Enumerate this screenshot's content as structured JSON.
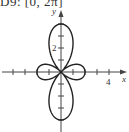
{
  "title": "D9: [0, 2π]",
  "chart_data": {
    "type": "line",
    "title": "D9: [0, 2π]",
    "xlabel": "x",
    "ylabel": "y",
    "x_tick_labels": [
      "4"
    ],
    "y_tick_labels": [
      "2"
    ],
    "xlim": [
      -5,
      5.5
    ],
    "ylim": [
      -4.2,
      5.5
    ],
    "grid": false,
    "curve": "polar rose with two long lobes on the y-axis reaching ±4 and two short lobes on the x-axis reaching ±2, drawn over θ in [0, 2π]",
    "series": [
      {
        "name": "polar curve",
        "points": [
          [
            0,
            4
          ],
          [
            0,
            -4
          ],
          [
            2,
            0
          ],
          [
            -2,
            0
          ],
          [
            0,
            0
          ]
        ]
      }
    ]
  },
  "labels": {
    "x_axis": "x",
    "y_axis": "y",
    "x_tick": "4",
    "y_tick": "2"
  }
}
